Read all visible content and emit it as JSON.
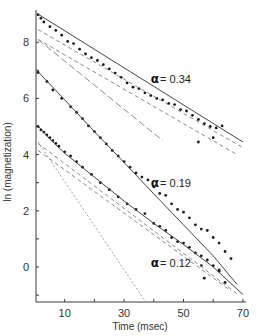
{
  "chart_data": {
    "type": "scatter",
    "title": "",
    "xlabel": "Time (msec)",
    "ylabel": "ln (magnetization)",
    "xlim": [
      0,
      70
    ],
    "ylim": [
      -1.2,
      9.2
    ],
    "x_ticks": [
      0,
      10,
      20,
      30,
      40,
      50,
      60,
      70
    ],
    "x_tick_labels": [
      {
        "value": 10,
        "label": "10"
      },
      {
        "value": 30,
        "label": "30"
      },
      {
        "value": 50,
        "label": "50"
      },
      {
        "value": 70,
        "label": "70"
      }
    ],
    "y_ticks": [
      -1,
      0,
      1,
      2,
      3,
      4,
      5,
      6,
      7,
      8
    ],
    "y_tick_labels": [
      {
        "value": 0,
        "label": "0"
      },
      {
        "value": 2,
        "label": "2"
      },
      {
        "value": 4,
        "label": "4"
      },
      {
        "value": 6,
        "label": "6"
      },
      {
        "value": 8,
        "label": "8"
      }
    ],
    "grid": false,
    "legend": null,
    "annotations": [
      {
        "text": "α = 0.34",
        "alpha_symbol": "α",
        "value_text": "= 0.34",
        "x": 39,
        "y": 6.7
      },
      {
        "text": "α = 0.19",
        "alpha_symbol": "α",
        "value_text": "= 0.19",
        "x": 39,
        "y": 3.0
      },
      {
        "text": "α = 0.12",
        "alpha_symbol": "α",
        "value_text": "= 0.12",
        "x": 39,
        "y": 0.15
      }
    ],
    "series": [
      {
        "name": "α = 0.34 data",
        "kind": "points",
        "points": [
          [
            1,
            8.98
          ],
          [
            2,
            8.85
          ],
          [
            3,
            8.72
          ],
          [
            5,
            8.55
          ],
          [
            7,
            8.42
          ],
          [
            9,
            8.25
          ],
          [
            11,
            8.03
          ],
          [
            13,
            7.95
          ],
          [
            15,
            7.75
          ],
          [
            17,
            7.58
          ],
          [
            19,
            7.45
          ],
          [
            21,
            7.35
          ],
          [
            23,
            7.2
          ],
          [
            25,
            7.05
          ],
          [
            27,
            6.9
          ],
          [
            29,
            6.75
          ],
          [
            31,
            6.55
          ],
          [
            33,
            6.4
          ],
          [
            35,
            6.35
          ],
          [
            37,
            6.2
          ],
          [
            39,
            6.1
          ],
          [
            41,
            6.0
          ],
          [
            43,
            5.95
          ],
          [
            45,
            5.82
          ],
          [
            47,
            5.78
          ],
          [
            49,
            5.6
          ],
          [
            51,
            5.55
          ],
          [
            53,
            5.4
          ],
          [
            55,
            5.25
          ],
          [
            57,
            5.1
          ],
          [
            59,
            5.0
          ],
          [
            61,
            4.95
          ],
          [
            63,
            5.02
          ],
          [
            55,
            4.45
          ],
          [
            60,
            4.6
          ]
        ]
      },
      {
        "name": "α = 0.34 fit",
        "kind": "line",
        "style": "solid",
        "points": [
          [
            1,
            9.0
          ],
          [
            70,
            4.45
          ]
        ]
      },
      {
        "name": "α = 0.34 component 1",
        "kind": "line",
        "style": "dashed",
        "points": [
          [
            1,
            8.45
          ],
          [
            70,
            4.25
          ]
        ]
      },
      {
        "name": "α = 0.34 component 2",
        "kind": "line",
        "style": "dashed",
        "points": [
          [
            1,
            8.1
          ],
          [
            68,
            4.0
          ]
        ]
      },
      {
        "name": "α = 0.34 component 3",
        "kind": "line",
        "style": "long-dashed",
        "points": [
          [
            1,
            8.1
          ],
          [
            43,
            4.5
          ]
        ]
      },
      {
        "name": "α = 0.19 data",
        "kind": "points",
        "points": [
          [
            1,
            6.92
          ],
          [
            4,
            6.6
          ],
          [
            6,
            6.3
          ],
          [
            9,
            6.0
          ],
          [
            12,
            5.7
          ],
          [
            14,
            5.5
          ],
          [
            16,
            5.28
          ],
          [
            18,
            5.02
          ],
          [
            20,
            4.82
          ],
          [
            22,
            4.6
          ],
          [
            24,
            4.38
          ],
          [
            26,
            4.15
          ],
          [
            28,
            3.95
          ],
          [
            30,
            3.75
          ],
          [
            32,
            3.55
          ],
          [
            34,
            3.35
          ],
          [
            36,
            3.2
          ],
          [
            38,
            3.1
          ],
          [
            40,
            2.85
          ],
          [
            42,
            2.62
          ],
          [
            44,
            2.55
          ],
          [
            46,
            2.25
          ],
          [
            48,
            2.05
          ],
          [
            50,
            1.95
          ],
          [
            52,
            1.75
          ],
          [
            54,
            1.5
          ],
          [
            56,
            1.35
          ],
          [
            58,
            1.3
          ],
          [
            60,
            1.05
          ],
          [
            62,
            0.85
          ],
          [
            64,
            0.55
          ],
          [
            66,
            0.3
          ],
          [
            56,
            0.05
          ],
          [
            62,
            -0.15
          ]
        ]
      },
      {
        "name": "α = 0.19 fit",
        "kind": "line",
        "style": "solid",
        "points": [
          [
            1,
            6.95
          ],
          [
            10,
            5.95
          ],
          [
            20,
            4.82
          ],
          [
            30,
            3.72
          ],
          [
            40,
            2.6
          ],
          [
            50,
            1.5
          ],
          [
            60,
            0.4
          ],
          [
            68,
            -0.62
          ]
        ]
      },
      {
        "name": "α = 0.12 data",
        "kind": "points",
        "points": [
          [
            1,
            5.0
          ],
          [
            2,
            4.88
          ],
          [
            3,
            4.8
          ],
          [
            4,
            4.7
          ],
          [
            5,
            4.6
          ],
          [
            6,
            4.5
          ],
          [
            7,
            4.4
          ],
          [
            8,
            4.3
          ],
          [
            10,
            4.1
          ],
          [
            12,
            3.95
          ],
          [
            14,
            3.75
          ],
          [
            16,
            3.55
          ],
          [
            19,
            3.3
          ],
          [
            22,
            3.0
          ],
          [
            25,
            2.75
          ],
          [
            28,
            2.5
          ],
          [
            31,
            2.25
          ],
          [
            34,
            2.05
          ],
          [
            37,
            1.9
          ],
          [
            40,
            1.55
          ],
          [
            42,
            1.45
          ],
          [
            44,
            1.3
          ],
          [
            46,
            1.05
          ],
          [
            48,
            0.9
          ],
          [
            50,
            0.85
          ],
          [
            52,
            0.7
          ],
          [
            54,
            0.5
          ],
          [
            56,
            0.4
          ],
          [
            58,
            0.25
          ],
          [
            60,
            0.05
          ],
          [
            62,
            -0.1
          ],
          [
            57,
            -0.4
          ],
          [
            64,
            -0.55
          ]
        ]
      },
      {
        "name": "α = 0.12 fit",
        "kind": "line",
        "style": "solid",
        "points": [
          [
            1,
            5.02
          ],
          [
            5,
            4.55
          ],
          [
            10,
            4.05
          ],
          [
            20,
            3.2
          ],
          [
            30,
            2.35
          ],
          [
            40,
            1.55
          ],
          [
            50,
            0.8
          ],
          [
            60,
            0.0
          ],
          [
            70,
            -0.98
          ]
        ]
      },
      {
        "name": "α = 0.12 component 1",
        "kind": "line",
        "style": "dashed",
        "points": [
          [
            1,
            4.4
          ],
          [
            68,
            -0.95
          ]
        ]
      },
      {
        "name": "α = 0.12 component 2",
        "kind": "line",
        "style": "dashed",
        "points": [
          [
            1,
            4.15
          ],
          [
            66,
            -0.85
          ]
        ]
      },
      {
        "name": "α = 0.12 component 3",
        "kind": "line",
        "style": "dotted",
        "points": [
          [
            1,
            4.45
          ],
          [
            37,
            -1.2
          ]
        ]
      }
    ]
  },
  "layout": {
    "plot_left_px": 35,
    "plot_top_px": 8,
    "px_per_x": 2.97,
    "x0_px": 35,
    "y0_px": 267,
    "px_per_y": 28.1,
    "axis_bottom_px": 302,
    "axis_right_px": 246,
    "axis_top_px": 10,
    "ink_color": "#3a3a3a",
    "dash_color": "#8a8a8a"
  }
}
